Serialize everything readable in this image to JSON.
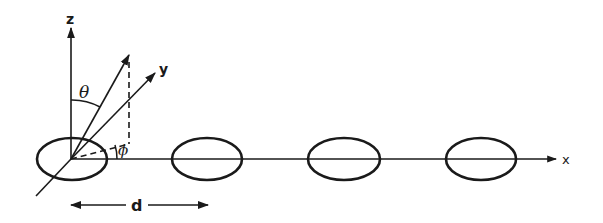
{
  "diagram": {
    "type": "antenna-array-geometry",
    "colors": {
      "ink": "#1a1a1a",
      "background": "#ffffff"
    },
    "axes": {
      "z_label": "z",
      "y_label": "y",
      "x_label": "x"
    },
    "angles": {
      "theta_label": "θ",
      "phi_label": "ϕ"
    },
    "spacing": {
      "label": "d"
    },
    "elements": [
      {
        "id": 1,
        "cx": 72,
        "cy": 159
      },
      {
        "id": 2,
        "cx": 207,
        "cy": 159
      },
      {
        "id": 3,
        "cx": 344,
        "cy": 159
      },
      {
        "id": 4,
        "cx": 481,
        "cy": 159
      }
    ],
    "element_count": 4
  }
}
